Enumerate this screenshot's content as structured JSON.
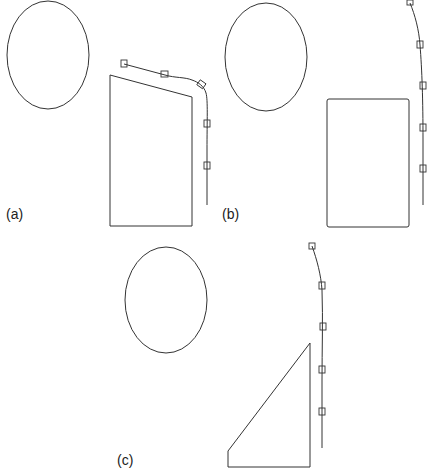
{
  "panels": [
    {
      "label": "(a)",
      "label_pos": [
        6,
        206
      ]
    },
    {
      "label": "(b)",
      "label_pos": [
        222,
        206
      ]
    },
    {
      "label": "(c)",
      "label_pos": [
        117,
        452
      ]
    }
  ],
  "stroke_color": "#333333"
}
